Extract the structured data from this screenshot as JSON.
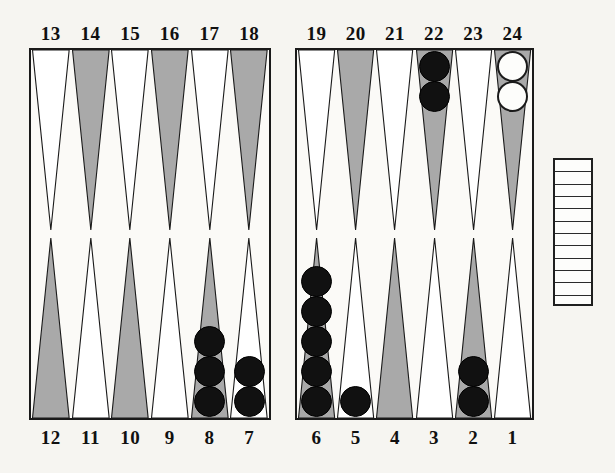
{
  "board": {
    "title": "Backgammon board position",
    "background_color": "#f6f5f1",
    "border_color": "#1a1a1a",
    "point_shaded_color": "#a9a9a9",
    "point_plain_color": "#ffffff",
    "black_checker_color": "#111111",
    "white_checker_color": "#fdfdfb"
  },
  "quadrants": {
    "top_left": {
      "name": "top-left-quadrant",
      "labels": [
        "13",
        "14",
        "15",
        "16",
        "17",
        "18"
      ]
    },
    "top_right": {
      "name": "top-right-quadrant",
      "labels": [
        "19",
        "20",
        "21",
        "22",
        "23",
        "24"
      ]
    },
    "bottom_left": {
      "name": "bottom-left-quadrant",
      "labels": [
        "12",
        "11",
        "10",
        "9",
        "8",
        "7"
      ]
    },
    "bottom_right": {
      "name": "bottom-right-quadrant",
      "labels": [
        "6",
        "5",
        "4",
        "3",
        "2",
        "1"
      ]
    }
  },
  "points": [
    {
      "label": "13",
      "row": "top",
      "half": "left",
      "slot": 0,
      "shaded": false,
      "checkers": 0,
      "color": ""
    },
    {
      "label": "14",
      "row": "top",
      "half": "left",
      "slot": 1,
      "shaded": true,
      "checkers": 0,
      "color": ""
    },
    {
      "label": "15",
      "row": "top",
      "half": "left",
      "slot": 2,
      "shaded": false,
      "checkers": 0,
      "color": ""
    },
    {
      "label": "16",
      "row": "top",
      "half": "left",
      "slot": 3,
      "shaded": true,
      "checkers": 0,
      "color": ""
    },
    {
      "label": "17",
      "row": "top",
      "half": "left",
      "slot": 4,
      "shaded": false,
      "checkers": 0,
      "color": ""
    },
    {
      "label": "18",
      "row": "top",
      "half": "left",
      "slot": 5,
      "shaded": true,
      "checkers": 0,
      "color": ""
    },
    {
      "label": "19",
      "row": "top",
      "half": "right",
      "slot": 0,
      "shaded": false,
      "checkers": 0,
      "color": ""
    },
    {
      "label": "20",
      "row": "top",
      "half": "right",
      "slot": 1,
      "shaded": true,
      "checkers": 0,
      "color": ""
    },
    {
      "label": "21",
      "row": "top",
      "half": "right",
      "slot": 2,
      "shaded": false,
      "checkers": 0,
      "color": ""
    },
    {
      "label": "22",
      "row": "top",
      "half": "right",
      "slot": 3,
      "shaded": true,
      "checkers": 2,
      "color": "black"
    },
    {
      "label": "23",
      "row": "top",
      "half": "right",
      "slot": 4,
      "shaded": false,
      "checkers": 0,
      "color": ""
    },
    {
      "label": "24",
      "row": "top",
      "half": "right",
      "slot": 5,
      "shaded": true,
      "checkers": 2,
      "color": "white"
    },
    {
      "label": "12",
      "row": "bottom",
      "half": "left",
      "slot": 0,
      "shaded": true,
      "checkers": 0,
      "color": ""
    },
    {
      "label": "11",
      "row": "bottom",
      "half": "left",
      "slot": 1,
      "shaded": false,
      "checkers": 0,
      "color": ""
    },
    {
      "label": "10",
      "row": "bottom",
      "half": "left",
      "slot": 2,
      "shaded": true,
      "checkers": 0,
      "color": ""
    },
    {
      "label": "9",
      "row": "bottom",
      "half": "left",
      "slot": 3,
      "shaded": false,
      "checkers": 0,
      "color": ""
    },
    {
      "label": "8",
      "row": "bottom",
      "half": "left",
      "slot": 4,
      "shaded": true,
      "checkers": 3,
      "color": "black"
    },
    {
      "label": "7",
      "row": "bottom",
      "half": "left",
      "slot": 5,
      "shaded": false,
      "checkers": 2,
      "color": "black"
    },
    {
      "label": "6",
      "row": "bottom",
      "half": "right",
      "slot": 0,
      "shaded": true,
      "checkers": 5,
      "color": "black"
    },
    {
      "label": "5",
      "row": "bottom",
      "half": "right",
      "slot": 1,
      "shaded": false,
      "checkers": 1,
      "color": "black"
    },
    {
      "label": "4",
      "row": "bottom",
      "half": "right",
      "slot": 2,
      "shaded": true,
      "checkers": 0,
      "color": ""
    },
    {
      "label": "3",
      "row": "bottom",
      "half": "right",
      "slot": 3,
      "shaded": false,
      "checkers": 0,
      "color": ""
    },
    {
      "label": "2",
      "row": "bottom",
      "half": "right",
      "slot": 4,
      "shaded": true,
      "checkers": 2,
      "color": "black"
    },
    {
      "label": "1",
      "row": "bottom",
      "half": "right",
      "slot": 5,
      "shaded": false,
      "checkers": 0,
      "color": ""
    }
  ],
  "bearoff_tray": {
    "name": "bearoff-tray",
    "slots": 12,
    "checkers": 0
  },
  "totals": {
    "black_on_board": 15,
    "white_on_board": 2
  }
}
